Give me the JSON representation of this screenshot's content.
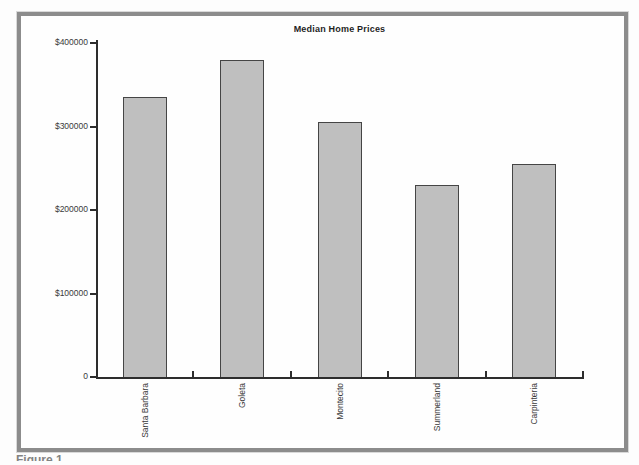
{
  "page": {
    "caption_fragment": "Figure 1"
  },
  "chart_data": {
    "type": "bar",
    "title": "Median Home Prices",
    "categories": [
      "Santa Barbara",
      "Goleta",
      "Montecito",
      "Summerland",
      "Carpinteria"
    ],
    "values": [
      335000,
      380000,
      305000,
      230000,
      255000
    ],
    "xlabel": "",
    "ylabel": "",
    "ylim": [
      0,
      400000
    ],
    "y_ticks": [
      {
        "label": "$400000",
        "value": 400000
      },
      {
        "label": "$300000",
        "value": 300000
      },
      {
        "label": "$200000",
        "value": 200000
      },
      {
        "label": "$100000",
        "value": 100000
      },
      {
        "label": "0",
        "value": 0
      }
    ],
    "grid": false,
    "legend": false,
    "colors": {
      "bar_fill": "#bfbfbf",
      "bar_border": "#454545",
      "axis": "#2d2d2d",
      "frame_border": "#8c8c8c",
      "text": "#3a3a3a"
    }
  }
}
